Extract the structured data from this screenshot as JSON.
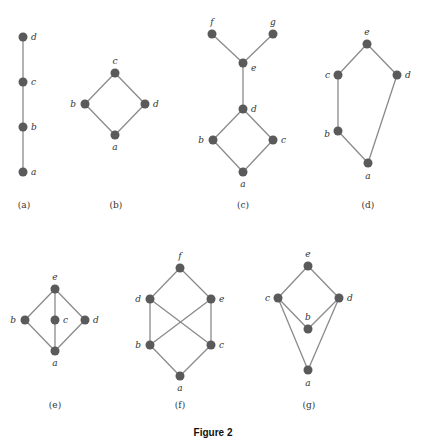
{
  "caption": "Figure 2",
  "graphs": [
    {
      "id": "a",
      "label": "(a)",
      "label_pos": [
        24,
        208
      ],
      "nodes": [
        {
          "name": "a",
          "x": 23,
          "y": 172,
          "lx": 31,
          "ly": 175,
          "anchor": "start"
        },
        {
          "name": "b",
          "x": 23,
          "y": 127,
          "lx": 31,
          "ly": 130,
          "anchor": "start"
        },
        {
          "name": "c",
          "x": 23,
          "y": 82,
          "lx": 31,
          "ly": 85,
          "anchor": "start"
        },
        {
          "name": "d",
          "x": 23,
          "y": 37,
          "lx": 31,
          "ly": 40,
          "anchor": "start"
        }
      ],
      "edges": [
        [
          "a",
          "b"
        ],
        [
          "b",
          "c"
        ],
        [
          "c",
          "d"
        ]
      ]
    },
    {
      "id": "b",
      "label": "(b)",
      "label_pos": [
        116,
        208
      ],
      "nodes": [
        {
          "name": "a",
          "x": 115,
          "y": 135,
          "lx": 115,
          "ly": 150,
          "anchor": "middle"
        },
        {
          "name": "b",
          "x": 85,
          "y": 104,
          "lx": 76,
          "ly": 107,
          "anchor": "end"
        },
        {
          "name": "c",
          "x": 115,
          "y": 73,
          "lx": 115,
          "ly": 64,
          "anchor": "middle"
        },
        {
          "name": "d",
          "x": 145,
          "y": 104,
          "lx": 153,
          "ly": 107,
          "anchor": "start"
        }
      ],
      "edges": [
        [
          "a",
          "b"
        ],
        [
          "a",
          "d"
        ],
        [
          "b",
          "c"
        ],
        [
          "d",
          "c"
        ]
      ]
    },
    {
      "id": "c",
      "label": "(c)",
      "label_pos": [
        243,
        208
      ],
      "nodes": [
        {
          "name": "a",
          "x": 243,
          "y": 172,
          "lx": 243,
          "ly": 187,
          "anchor": "middle"
        },
        {
          "name": "b",
          "x": 213,
          "y": 140,
          "lx": 204,
          "ly": 143,
          "anchor": "end"
        },
        {
          "name": "c",
          "x": 273,
          "y": 140,
          "lx": 281,
          "ly": 143,
          "anchor": "start"
        },
        {
          "name": "d",
          "x": 243,
          "y": 109,
          "lx": 251,
          "ly": 112,
          "anchor": "start"
        },
        {
          "name": "e",
          "x": 243,
          "y": 63,
          "lx": 251,
          "ly": 71,
          "anchor": "start"
        },
        {
          "name": "f",
          "x": 212,
          "y": 34,
          "lx": 212,
          "ly": 25,
          "anchor": "middle"
        },
        {
          "name": "g",
          "x": 273,
          "y": 34,
          "lx": 273,
          "ly": 25,
          "anchor": "middle"
        }
      ],
      "edges": [
        [
          "a",
          "b"
        ],
        [
          "a",
          "c"
        ],
        [
          "b",
          "d"
        ],
        [
          "c",
          "d"
        ],
        [
          "d",
          "e"
        ],
        [
          "e",
          "f"
        ],
        [
          "e",
          "g"
        ]
      ]
    },
    {
      "id": "d",
      "label": "(d)",
      "label_pos": [
        368,
        208
      ],
      "nodes": [
        {
          "name": "a",
          "x": 368,
          "y": 163,
          "lx": 368,
          "ly": 179,
          "anchor": "middle"
        },
        {
          "name": "b",
          "x": 338,
          "y": 131,
          "lx": 330,
          "ly": 137,
          "anchor": "end"
        },
        {
          "name": "c",
          "x": 338,
          "y": 75,
          "lx": 330,
          "ly": 78,
          "anchor": "end"
        },
        {
          "name": "d",
          "x": 397,
          "y": 75,
          "lx": 405,
          "ly": 78,
          "anchor": "start"
        },
        {
          "name": "e",
          "x": 367,
          "y": 44,
          "lx": 367,
          "ly": 35,
          "anchor": "middle"
        }
      ],
      "edges": [
        [
          "a",
          "b"
        ],
        [
          "b",
          "c"
        ],
        [
          "c",
          "e"
        ],
        [
          "a",
          "d"
        ],
        [
          "d",
          "e"
        ]
      ]
    },
    {
      "id": "e",
      "label": "(e)",
      "label_pos": [
        55,
        408
      ],
      "nodes": [
        {
          "name": "a",
          "x": 55,
          "y": 351,
          "lx": 55,
          "ly": 366,
          "anchor": "middle"
        },
        {
          "name": "b",
          "x": 25,
          "y": 320,
          "lx": 16,
          "ly": 323,
          "anchor": "end"
        },
        {
          "name": "c",
          "x": 55,
          "y": 320,
          "lx": 63,
          "ly": 323,
          "anchor": "start"
        },
        {
          "name": "d",
          "x": 85,
          "y": 320,
          "lx": 93,
          "ly": 323,
          "anchor": "start"
        },
        {
          "name": "e",
          "x": 55,
          "y": 289,
          "lx": 55,
          "ly": 280,
          "anchor": "middle"
        }
      ],
      "edges": [
        [
          "a",
          "b"
        ],
        [
          "a",
          "c"
        ],
        [
          "a",
          "d"
        ],
        [
          "b",
          "e"
        ],
        [
          "c",
          "e"
        ],
        [
          "d",
          "e"
        ]
      ]
    },
    {
      "id": "f",
      "label": "(f)",
      "label_pos": [
        180,
        408
      ],
      "nodes": [
        {
          "name": "a",
          "x": 180,
          "y": 376,
          "lx": 180,
          "ly": 391,
          "anchor": "middle"
        },
        {
          "name": "b",
          "x": 150,
          "y": 345,
          "lx": 141,
          "ly": 348,
          "anchor": "end"
        },
        {
          "name": "c",
          "x": 211,
          "y": 345,
          "lx": 219,
          "ly": 348,
          "anchor": "start"
        },
        {
          "name": "d",
          "x": 150,
          "y": 299,
          "lx": 141,
          "ly": 302,
          "anchor": "end"
        },
        {
          "name": "e",
          "x": 211,
          "y": 299,
          "lx": 219,
          "ly": 302,
          "anchor": "start"
        },
        {
          "name": "f",
          "x": 180,
          "y": 268,
          "lx": 180,
          "ly": 259,
          "anchor": "middle"
        }
      ],
      "edges": [
        [
          "a",
          "b"
        ],
        [
          "a",
          "c"
        ],
        [
          "b",
          "d"
        ],
        [
          "b",
          "e"
        ],
        [
          "c",
          "d"
        ],
        [
          "c",
          "e"
        ],
        [
          "d",
          "f"
        ],
        [
          "e",
          "f"
        ]
      ]
    },
    {
      "id": "g",
      "label": "(g)",
      "label_pos": [
        309,
        408
      ],
      "nodes": [
        {
          "name": "a",
          "x": 308,
          "y": 370,
          "lx": 308,
          "ly": 386,
          "anchor": "middle"
        },
        {
          "name": "b",
          "x": 308,
          "y": 329,
          "lx": 308,
          "ly": 320,
          "anchor": "middle"
        },
        {
          "name": "c",
          "x": 278,
          "y": 298,
          "lx": 270,
          "ly": 301,
          "anchor": "end"
        },
        {
          "name": "d",
          "x": 339,
          "y": 298,
          "lx": 347,
          "ly": 301,
          "anchor": "start"
        },
        {
          "name": "e",
          "x": 308,
          "y": 266,
          "lx": 308,
          "ly": 257,
          "anchor": "middle"
        }
      ],
      "edges": [
        [
          "a",
          "c"
        ],
        [
          "a",
          "d"
        ],
        [
          "b",
          "c"
        ],
        [
          "b",
          "d"
        ],
        [
          "c",
          "e"
        ],
        [
          "d",
          "e"
        ]
      ]
    }
  ],
  "style": {
    "node_color": "#5a5a5a",
    "edge_color": "#8a8a8a",
    "node_radius": 4.5
  }
}
